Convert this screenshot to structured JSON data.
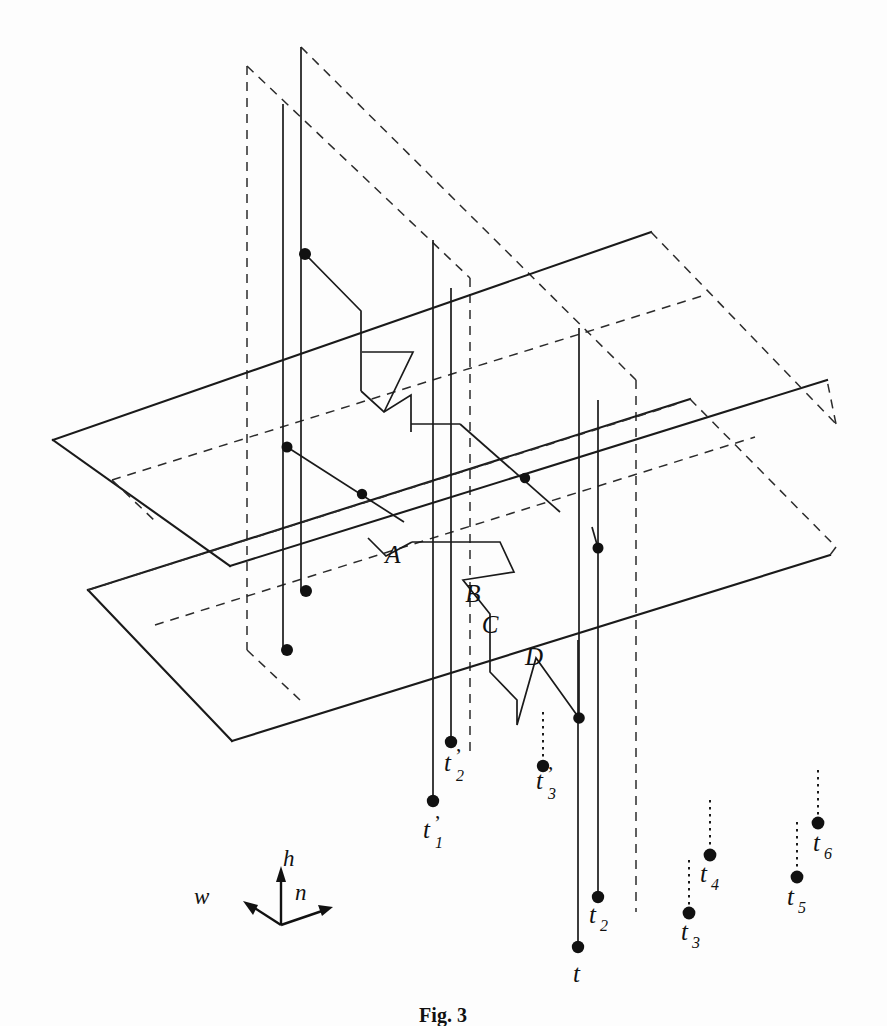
{
  "figure": {
    "caption": "Fig. 3",
    "background_color": "#fdfdfd",
    "line_color": "#1a1a1a",
    "dash_color": "#2b2b2b"
  },
  "axes": {
    "origin_label": "",
    "h_label": "h",
    "n_label": "n",
    "w_label": "w"
  },
  "connector_labels": [
    {
      "id": "A",
      "text": "A",
      "x": 393,
      "y": 563
    },
    {
      "id": "B",
      "text": "B",
      "x": 473,
      "y": 602
    },
    {
      "id": "C",
      "text": "C",
      "x": 490,
      "y": 633
    },
    {
      "id": "D",
      "text": "D",
      "x": 534,
      "y": 665
    }
  ],
  "trace_labels": [
    {
      "id": "t1p",
      "base": "t",
      "sub": "1",
      "prime": true,
      "x": 423,
      "y": 838
    },
    {
      "id": "t2p",
      "base": "t",
      "sub": "2",
      "prime": true,
      "x": 444,
      "y": 771
    },
    {
      "id": "t3p",
      "base": "t",
      "sub": "3",
      "prime": true,
      "x": 536,
      "y": 789
    },
    {
      "id": "t",
      "base": "t",
      "sub": "",
      "prime": false,
      "x": 573,
      "y": 962
    },
    {
      "id": "t2",
      "base": "t",
      "sub": "2",
      "prime": false,
      "x": 589,
      "y": 923
    },
    {
      "id": "t3",
      "base": "t",
      "sub": "3",
      "prime": false,
      "x": 681,
      "y": 940
    },
    {
      "id": "t4",
      "base": "t",
      "sub": "4",
      "prime": false,
      "x": 700,
      "y": 882
    },
    {
      "id": "t5",
      "base": "t",
      "sub": "5",
      "prime": false,
      "x": 787,
      "y": 905
    },
    {
      "id": "t6",
      "base": "t",
      "sub": "6",
      "prime": false,
      "x": 813,
      "y": 851
    }
  ],
  "geometry": {
    "plane_upper": {
      "solid_front": "M 53,440 L 651,232",
      "solid_left_down": "M 53,440 L 230,566",
      "solid_bottom": "M 230,566 L 827,380",
      "dashed_right": "M 651,232 L 836,424",
      "dashed_back": "M 836,424 L 827,380"
    },
    "plane_lower": {
      "solid_front": "M 88,590 L 690,399",
      "solid_left_down": "M 88,590 L 232,741",
      "solid_bottom": "M 232,741 L 830,555",
      "dashed_right": "M 690,399 L 836,547"
    },
    "vertical_sheet_left": {
      "top_dash": "M 247,66 L 470,278",
      "left_dash": "M 247,66 L 247,630"
    },
    "vertical_sheet_right": {
      "top_dash": "M 301,47 L 636,380",
      "right_dash": "M 636,380 L 636,910"
    }
  },
  "node_points": [
    {
      "x": 305,
      "y": 254
    },
    {
      "x": 287,
      "y": 447
    },
    {
      "x": 362,
      "y": 494
    },
    {
      "x": 525,
      "y": 478
    },
    {
      "x": 598,
      "y": 548
    },
    {
      "x": 306,
      "y": 591
    },
    {
      "x": 287,
      "y": 650
    },
    {
      "x": 450,
      "y": 742
    },
    {
      "x": 579,
      "y": 718
    },
    {
      "x": 433,
      "y": 801
    },
    {
      "x": 543,
      "y": 766
    },
    {
      "x": 598,
      "y": 897
    },
    {
      "x": 578,
      "y": 947
    },
    {
      "x": 689,
      "y": 913
    },
    {
      "x": 710,
      "y": 855
    },
    {
      "x": 797,
      "y": 877
    },
    {
      "x": 818,
      "y": 823
    }
  ]
}
